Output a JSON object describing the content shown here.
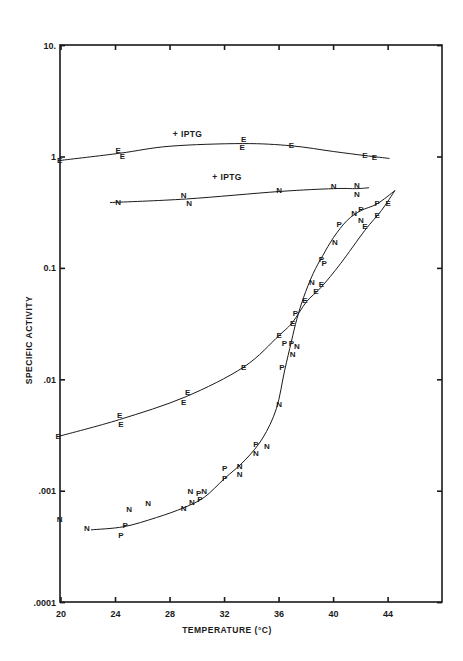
{
  "chart_data": {
    "type": "scatter",
    "title": "",
    "xlabel": "TEMPERATURE (°C)",
    "ylabel": "SPECIFIC ACTIVITY",
    "xlim": [
      20,
      48
    ],
    "ylim": [
      0.0001,
      10
    ],
    "yscale": "log",
    "grid": false,
    "legend": "none (series marked by letters E, N, P)",
    "x_ticks": [
      20,
      24,
      28,
      32,
      36,
      40,
      44
    ],
    "x_tick_labels": [
      "20",
      "24",
      "28",
      "32",
      "36",
      "40",
      "44"
    ],
    "y_ticks": [
      0.0001,
      0.001,
      0.01,
      0.1,
      1,
      10
    ],
    "y_tick_labels": [
      ".0001",
      ".001",
      ".01",
      "0.1",
      "1",
      "10."
    ],
    "annotations": [
      {
        "text": "+ IPTG",
        "x": 28.2,
        "y": 1.5,
        "refers_to": "E +IPTG"
      },
      {
        "text": "+ IPTG",
        "x": 31.1,
        "y": 0.62,
        "refers_to": "N +IPTG"
      }
    ],
    "series": [
      {
        "name": "E +IPTG",
        "marker": "E",
        "points": [
          [
            19.9,
            0.93
          ],
          [
            24.2,
            1.14
          ],
          [
            24.5,
            1.02
          ],
          [
            33.4,
            1.44
          ],
          [
            33.3,
            1.22
          ],
          [
            36.9,
            1.26
          ],
          [
            42.3,
            1.03
          ],
          [
            43.0,
            0.98
          ]
        ],
        "curve": [
          [
            19.9,
            0.93
          ],
          [
            24.3,
            1.08
          ],
          [
            28,
            1.25
          ],
          [
            33.3,
            1.32
          ],
          [
            36.9,
            1.26
          ],
          [
            40,
            1.12
          ],
          [
            42.3,
            1.03
          ],
          [
            44.1,
            0.97
          ]
        ]
      },
      {
        "name": "N +IPTG",
        "marker": "N",
        "points": [
          [
            24.2,
            0.39
          ],
          [
            29.0,
            0.45
          ],
          [
            29.4,
            0.38
          ],
          [
            36.0,
            0.5
          ],
          [
            40.0,
            0.54
          ],
          [
            41.7,
            0.55
          ],
          [
            41.7,
            0.46
          ]
        ],
        "curve": [
          [
            23.6,
            0.39
          ],
          [
            29.2,
            0.42
          ],
          [
            36.0,
            0.49
          ],
          [
            40.0,
            0.52
          ],
          [
            41.7,
            0.52
          ],
          [
            42.6,
            0.53
          ]
        ]
      },
      {
        "name": "E",
        "marker": "E",
        "points": [
          [
            19.8,
            0.0031
          ],
          [
            24.3,
            0.0048
          ],
          [
            24.4,
            0.004
          ],
          [
            29.3,
            0.0077
          ],
          [
            29.0,
            0.0063
          ],
          [
            33.4,
            0.013
          ],
          [
            36.0,
            0.025
          ],
          [
            37.0,
            0.032
          ],
          [
            37.9,
            0.051
          ],
          [
            38.7,
            0.062
          ],
          [
            39.1,
            0.071
          ],
          [
            42.3,
            0.24
          ],
          [
            43.2,
            0.3
          ],
          [
            44.0,
            0.38
          ]
        ],
        "curve": [
          [
            19.8,
            0.0031
          ],
          [
            24.3,
            0.0044
          ],
          [
            29.1,
            0.007
          ],
          [
            33.4,
            0.013
          ],
          [
            36.0,
            0.025
          ],
          [
            37.0,
            0.033
          ],
          [
            38.0,
            0.05
          ],
          [
            39.1,
            0.068
          ],
          [
            40.5,
            0.11
          ],
          [
            42.3,
            0.22
          ],
          [
            43.5,
            0.33
          ],
          [
            44.5,
            0.5
          ]
        ]
      },
      {
        "name": "P",
        "marker": "P",
        "points": [
          [
            24.4,
            0.0004
          ],
          [
            24.7,
            0.00049
          ],
          [
            30.1,
            0.00095
          ],
          [
            30.2,
            0.00084
          ],
          [
            32.0,
            0.0016
          ],
          [
            32.0,
            0.0013
          ],
          [
            34.3,
            0.0026
          ],
          [
            36.2,
            0.013
          ],
          [
            36.4,
            0.021
          ],
          [
            36.9,
            0.021
          ],
          [
            37.2,
            0.039
          ],
          [
            39.1,
            0.12
          ],
          [
            39.3,
            0.11
          ],
          [
            40.4,
            0.25
          ],
          [
            42.0,
            0.34
          ],
          [
            43.2,
            0.38
          ]
        ]
      },
      {
        "name": "N",
        "marker": "N",
        "points": [
          [
            19.9,
            0.00056
          ],
          [
            21.9,
            0.00046
          ],
          [
            25.0,
            0.00068
          ],
          [
            26.4,
            0.00077
          ],
          [
            29.0,
            0.0007
          ],
          [
            29.6,
            0.00079
          ],
          [
            29.5,
            0.00099
          ],
          [
            30.5,
            0.001
          ],
          [
            33.1,
            0.00166
          ],
          [
            33.1,
            0.00142
          ],
          [
            34.3,
            0.0022
          ],
          [
            35.1,
            0.0025
          ],
          [
            36.0,
            0.006
          ],
          [
            37.0,
            0.017
          ],
          [
            37.3,
            0.02
          ],
          [
            38.4,
            0.074
          ],
          [
            40.1,
            0.17
          ],
          [
            41.5,
            0.31
          ],
          [
            42.0,
            0.27
          ]
        ]
      },
      {
        "name": "N/P fitted curve",
        "marker": "",
        "curve": [
          [
            22.2,
            0.00045
          ],
          [
            24.6,
            0.00048
          ],
          [
            27,
            0.00058
          ],
          [
            29,
            0.00071
          ],
          [
            30.5,
            0.00088
          ],
          [
            32,
            0.0013
          ],
          [
            33.5,
            0.0019
          ],
          [
            34.8,
            0.003
          ],
          [
            35.8,
            0.0055
          ],
          [
            36.4,
            0.012
          ],
          [
            36.9,
            0.022
          ],
          [
            37.3,
            0.035
          ],
          [
            37.8,
            0.055
          ],
          [
            38.5,
            0.09
          ],
          [
            39.2,
            0.13
          ],
          [
            40.0,
            0.19
          ],
          [
            41.0,
            0.27
          ],
          [
            42.0,
            0.33
          ],
          [
            43.2,
            0.38
          ],
          [
            44.5,
            0.5
          ]
        ]
      }
    ]
  },
  "axes": {
    "x_label": "TEMPERATURE (°C)",
    "y_label": "SPECIFIC ACTIVITY"
  }
}
